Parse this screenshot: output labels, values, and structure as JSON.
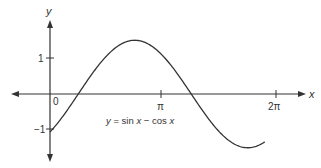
{
  "chart_data": {
    "type": "line",
    "title": "",
    "xlabel": "x",
    "ylabel": "y",
    "x_ticks": [
      "0",
      "π",
      "2π"
    ],
    "y_ticks": [
      "1",
      "−1"
    ],
    "xlim": [
      -1.05,
      2.3
    ],
    "ylim": [
      -1.85,
      2.0
    ],
    "grid": false,
    "legend": null,
    "annotation": "y = sin x − cos x",
    "series": [
      {
        "name": "y = sin x − cos x",
        "function": "sin(x) - cos(x)",
        "domain": [
          0,
          1.9
        ],
        "domain_units": "pi",
        "key_points": [
          {
            "x": "0",
            "y": -1
          },
          {
            "x": "π/4",
            "y": 0
          },
          {
            "x": "3π/4",
            "y": 1.414
          },
          {
            "x": "5π/4",
            "y": 0
          },
          {
            "x": "7π/4",
            "y": -1.414
          }
        ]
      }
    ]
  },
  "labels": {
    "x_axis": "x",
    "y_axis": "y",
    "origin": "0",
    "pi": "π",
    "two_pi": "2π",
    "y_one": "1",
    "y_minus_one": "−1",
    "equation_y": "y",
    "equation_eq": " = sin ",
    "equation_x1": "x",
    "equation_minus": " − cos ",
    "equation_x2": "x"
  },
  "colors": {
    "axis": "#333333",
    "curve": "#333333",
    "background": "#ffffff"
  }
}
